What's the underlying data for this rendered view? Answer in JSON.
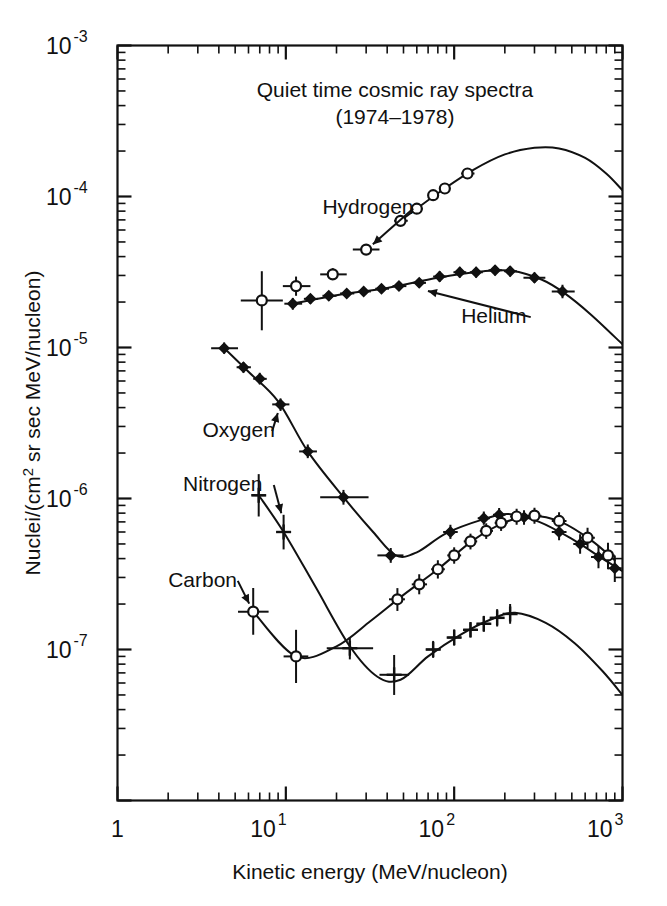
{
  "chart_data": {
    "type": "line",
    "title": "Quiet time cosmic ray spectra",
    "subtitle": "(1974–1978)",
    "xlabel": "Kinetic energy (MeV/nucleon)",
    "ylabel": "Nuclei/(cm² sr sec MeV/nucleon)",
    "xscale": "log",
    "yscale": "log",
    "xlim": [
      1,
      1000
    ],
    "ylim": [
      1e-08,
      0.001
    ],
    "grid": false,
    "legend_position": "inline-annotations",
    "xticklabels": [
      "1",
      "10",
      "10",
      "10"
    ],
    "xtick_exponents": [
      "",
      "1",
      "2",
      "3"
    ],
    "xticks": [
      1,
      10,
      100,
      1000
    ],
    "yticks": [
      0.001,
      0.0001,
      1e-05,
      1e-06,
      1e-07
    ],
    "yticklabels": [
      "10",
      "10",
      "10",
      "10",
      "10"
    ],
    "ytick_exponents": [
      "-3",
      "-4",
      "-5",
      "-6",
      "-7"
    ],
    "series": [
      {
        "name": "Hydrogen",
        "marker": "open-circle",
        "label_x": 16.5,
        "label_y": 7.6e-05,
        "arrow_to_x": 30,
        "arrow_to_y": 4.4e-05,
        "points": [
          {
            "x": 7.2,
            "y": 2.05e-05,
            "xerr_lo": 5.4,
            "xerr_hi": 9.6,
            "yerr_lo": 1.3e-05,
            "yerr_hi": 3.2e-05
          },
          {
            "x": 11.5,
            "y": 2.55e-05,
            "xerr_lo": 9.6,
            "xerr_hi": 14.0,
            "yerr_lo": 2.2e-05,
            "yerr_hi": 2.95e-05
          },
          {
            "x": 19.0,
            "y": 3.05e-05,
            "xerr_lo": 16.0,
            "xerr_hi": 23.0,
            "yerr_lo": 2.8e-05,
            "yerr_hi": 3.35e-05
          },
          {
            "x": 30.0,
            "y": 4.45e-05,
            "xerr_lo": 25.0,
            "xerr_hi": 36.0,
            "yerr_lo": 4.1e-05,
            "yerr_hi": 4.85e-05
          },
          {
            "x": 48.0,
            "y": 6.9e-05,
            "xerr_lo": 44.0,
            "xerr_hi": 53.0,
            "yerr_lo": 6.45e-05,
            "yerr_hi": 7.4e-05
          },
          {
            "x": 60.0,
            "y": 8.3e-05,
            "xerr_lo": 56.0,
            "xerr_hi": 65.0,
            "yerr_lo": 7.85e-05,
            "yerr_hi": 8.8e-05
          },
          {
            "x": 75.0,
            "y": 0.000102,
            "xerr_lo": 70.0,
            "xerr_hi": 81.0,
            "yerr_lo": 9.7e-05,
            "yerr_hi": 0.000108
          },
          {
            "x": 88.0,
            "y": 0.000113,
            "xerr_lo": 82.0,
            "xerr_hi": 95.0,
            "yerr_lo": 0.000107,
            "yerr_hi": 0.000119
          },
          {
            "x": 120.0,
            "y": 0.000142,
            "xerr_lo": 110.0,
            "xerr_hi": 132.0,
            "yerr_lo": 0.000135,
            "yerr_hi": 0.00015
          }
        ],
        "curve": [
          {
            "x": 48,
            "y": 6.9e-05
          },
          {
            "x": 80,
            "y": 0.000105
          },
          {
            "x": 130,
            "y": 0.00015
          },
          {
            "x": 200,
            "y": 0.00019
          },
          {
            "x": 300,
            "y": 0.00021
          },
          {
            "x": 420,
            "y": 0.000208
          },
          {
            "x": 600,
            "y": 0.00018
          },
          {
            "x": 800,
            "y": 0.000142
          },
          {
            "x": 1000,
            "y": 0.00011
          }
        ]
      },
      {
        "name": "Helium",
        "marker": "filled-diamond",
        "label_x": 110,
        "label_y": 1.45e-05,
        "arrow_to_x": 62,
        "arrow_to_y": 2.45e-05,
        "points": [
          {
            "x": 4.3,
            "y": 9.9e-06,
            "xerr_lo": 3.6,
            "xerr_hi": 5.2,
            "yerr_lo": 9.1e-06,
            "yerr_hi": 1.08e-05
          },
          {
            "x": 5.6,
            "y": 7.4e-06,
            "xerr_lo": 5.1,
            "xerr_hi": 6.2,
            "yerr_lo": 6.8e-06,
            "yerr_hi": 8e-06
          },
          {
            "x": 7.0,
            "y": 6.2e-06,
            "xerr_lo": 6.4,
            "xerr_hi": 7.7,
            "yerr_lo": 5.7e-06,
            "yerr_hi": 6.8e-06
          },
          {
            "x": 9.3,
            "y": 4.2e-06,
            "xerr_lo": 8.3,
            "xerr_hi": 10.5,
            "yerr_lo": 3.8e-06,
            "yerr_hi": 4.6e-06
          },
          {
            "x": 11.0,
            "y": 1.95e-05,
            "xerr_lo": 9.8,
            "xerr_hi": 12.5,
            "yerr_lo": 1.78e-05,
            "yerr_hi": 2.13e-05
          },
          {
            "x": 14.0,
            "y": 2.1e-05,
            "xerr_lo": 12.8,
            "xerr_hi": 15.5,
            "yerr_lo": 1.95e-05,
            "yerr_hi": 2.26e-05
          },
          {
            "x": 18.0,
            "y": 2.2e-05,
            "xerr_lo": 16.5,
            "xerr_hi": 20.0,
            "yerr_lo": 2.05e-05,
            "yerr_hi": 2.36e-05
          },
          {
            "x": 23.0,
            "y": 2.28e-05,
            "xerr_lo": 21.0,
            "xerr_hi": 25.5,
            "yerr_lo": 2.13e-05,
            "yerr_hi": 2.44e-05
          },
          {
            "x": 29.0,
            "y": 2.35e-05,
            "xerr_lo": 27.0,
            "xerr_hi": 32.0,
            "yerr_lo": 2.2e-05,
            "yerr_hi": 2.52e-05
          },
          {
            "x": 37.0,
            "y": 2.45e-05,
            "xerr_lo": 34.0,
            "xerr_hi": 41.0,
            "yerr_lo": 2.3e-05,
            "yerr_hi": 2.62e-05
          },
          {
            "x": 47.0,
            "y": 2.55e-05,
            "xerr_lo": 43.0,
            "xerr_hi": 52.0,
            "yerr_lo": 2.38e-05,
            "yerr_hi": 2.72e-05
          },
          {
            "x": 62.0,
            "y": 2.68e-05,
            "xerr_lo": 57.0,
            "xerr_hi": 68.0,
            "yerr_lo": 2.5e-05,
            "yerr_hi": 2.86e-05
          },
          {
            "x": 82.0,
            "y": 2.95e-05,
            "xerr_lo": 75.0,
            "xerr_hi": 90.0,
            "yerr_lo": 2.72e-05,
            "yerr_hi": 3.2e-05
          },
          {
            "x": 108.0,
            "y": 3.15e-05,
            "xerr_lo": 99.0,
            "xerr_hi": 118.0,
            "yerr_lo": 2.9e-05,
            "yerr_hi": 3.42e-05
          },
          {
            "x": 135.0,
            "y": 3.15e-05,
            "xerr_lo": 124.0,
            "xerr_hi": 148.0,
            "yerr_lo": 2.9e-05,
            "yerr_hi": 3.42e-05
          },
          {
            "x": 175.0,
            "y": 3.25e-05,
            "xerr_lo": 160.0,
            "xerr_hi": 192.0,
            "yerr_lo": 3e-05,
            "yerr_hi": 3.52e-05
          },
          {
            "x": 215.0,
            "y": 3.2e-05,
            "xerr_lo": 198.0,
            "xerr_hi": 236.0,
            "yerr_lo": 2.95e-05,
            "yerr_hi": 3.47e-05
          },
          {
            "x": 300.0,
            "y": 2.9e-05,
            "xerr_lo": 258.0,
            "xerr_hi": 348.0,
            "yerr_lo": 2.68e-05,
            "yerr_hi": 3.14e-05
          },
          {
            "x": 440.0,
            "y": 2.35e-05,
            "xerr_lo": 380.0,
            "xerr_hi": 520.0,
            "yerr_lo": 2.12e-05,
            "yerr_hi": 2.6e-05
          }
        ],
        "curve": [
          {
            "x": 11,
            "y": 1.95e-05
          },
          {
            "x": 20,
            "y": 2.22e-05
          },
          {
            "x": 40,
            "y": 2.48e-05
          },
          {
            "x": 80,
            "y": 2.9e-05
          },
          {
            "x": 150,
            "y": 3.2e-05
          },
          {
            "x": 220,
            "y": 3.22e-05
          },
          {
            "x": 330,
            "y": 2.82e-05
          },
          {
            "x": 450,
            "y": 2.3e-05
          },
          {
            "x": 650,
            "y": 1.65e-05
          },
          {
            "x": 1000,
            "y": 1.05e-05
          }
        ]
      },
      {
        "name": "Oxygen",
        "marker": "filled-diamond",
        "label_x": 3.2,
        "label_y": 2.55e-06,
        "arrow_to_x": 9.3,
        "arrow_to_y": 4.2e-06,
        "points": [
          {
            "x": 13.5,
            "y": 2.05e-06,
            "xerr_lo": 12.0,
            "xerr_hi": 15.3,
            "yerr_lo": 1.85e-06,
            "yerr_hi": 2.28e-06
          },
          {
            "x": 22.0,
            "y": 1.02e-06,
            "xerr_lo": 16.0,
            "xerr_hi": 31.0,
            "yerr_lo": 9.1e-07,
            "yerr_hi": 1.14e-06
          },
          {
            "x": 42.0,
            "y": 4.2e-07,
            "xerr_lo": 35.0,
            "xerr_hi": 50.0,
            "yerr_lo": 3.75e-07,
            "yerr_hi": 4.7e-07
          },
          {
            "x": 95.0,
            "y": 6e-07,
            "xerr_lo": 86.0,
            "xerr_hi": 105.0,
            "yerr_lo": 5.4e-07,
            "yerr_hi": 6.7e-07
          },
          {
            "x": 150.0,
            "y": 7.4e-07,
            "xerr_lo": 138.0,
            "xerr_hi": 163.0,
            "yerr_lo": 6.7e-07,
            "yerr_hi": 8.2e-07
          },
          {
            "x": 185.0,
            "y": 7.8e-07,
            "xerr_lo": 170.0,
            "xerr_hi": 202.0,
            "yerr_lo": 7e-07,
            "yerr_hi": 8.65e-07
          },
          {
            "x": 260.0,
            "y": 7.5e-07,
            "xerr_lo": 236.0,
            "xerr_hi": 288.0,
            "yerr_lo": 6.7e-07,
            "yerr_hi": 8.35e-07
          },
          {
            "x": 420.0,
            "y": 6e-07,
            "xerr_lo": 380.0,
            "xerr_hi": 465.0,
            "yerr_lo": 5.3e-07,
            "yerr_hi": 6.8e-07
          },
          {
            "x": 560.0,
            "y": 5e-07,
            "xerr_lo": 510.0,
            "xerr_hi": 620.0,
            "yerr_lo": 4.3e-07,
            "yerr_hi": 5.8e-07
          },
          {
            "x": 720.0,
            "y": 4.1e-07,
            "xerr_lo": 650.0,
            "xerr_hi": 800.0,
            "yerr_lo": 3.45e-07,
            "yerr_hi": 4.85e-07
          },
          {
            "x": 900.0,
            "y": 3.45e-07,
            "xerr_lo": 820.0,
            "xerr_hi": 990.0,
            "yerr_lo": 2.8e-07,
            "yerr_hi": 4.2e-07
          }
        ],
        "curve": [
          {
            "x": 4.3,
            "y": 9.9e-06
          },
          {
            "x": 6,
            "y": 6.9e-06
          },
          {
            "x": 9,
            "y": 4.4e-06
          },
          {
            "x": 13.5,
            "y": 2.05e-06
          },
          {
            "x": 22,
            "y": 1.02e-06
          },
          {
            "x": 33,
            "y": 6e-07
          },
          {
            "x": 45,
            "y": 4.2e-07
          },
          {
            "x": 60,
            "y": 4.4e-07
          },
          {
            "x": 90,
            "y": 5.9e-07
          },
          {
            "x": 150,
            "y": 7.3e-07
          },
          {
            "x": 210,
            "y": 7.9e-07
          },
          {
            "x": 320,
            "y": 7e-07
          },
          {
            "x": 500,
            "y": 5.4e-07
          },
          {
            "x": 760,
            "y": 4e-07
          },
          {
            "x": 1000,
            "y": 3.3e-07
          }
        ]
      },
      {
        "name": "Nitrogen",
        "marker": "plus",
        "label_x": 2.45,
        "label_y": 1.12e-06,
        "arrow_to_x": 9.7,
        "arrow_to_y": 7e-07,
        "points": [
          {
            "x": 6.9,
            "y": 1.05e-06,
            "xerr_lo": 6.3,
            "xerr_hi": 7.6,
            "yerr_lo": 7.6e-07,
            "yerr_hi": 1.45e-06
          },
          {
            "x": 9.7,
            "y": 6e-07,
            "xerr_lo": 8.8,
            "xerr_hi": 10.7,
            "yerr_lo": 4.6e-07,
            "yerr_hi": 7.8e-07
          },
          {
            "x": 24.0,
            "y": 1.02e-07,
            "xerr_lo": 17.5,
            "xerr_hi": 33.0,
            "yerr_lo": 8.6e-08,
            "yerr_hi": 1.21e-07
          },
          {
            "x": 44.0,
            "y": 6.8e-08,
            "xerr_lo": 36.0,
            "xerr_hi": 54.0,
            "yerr_lo": 5e-08,
            "yerr_hi": 9.2e-08
          },
          {
            "x": 75.0,
            "y": 1e-07,
            "xerr_lo": 68.0,
            "xerr_hi": 83.0,
            "yerr_lo": 8.8e-08,
            "yerr_hi": 1.14e-07
          },
          {
            "x": 100.0,
            "y": 1.2e-07,
            "xerr_lo": 91.0,
            "xerr_hi": 110.0,
            "yerr_lo": 1.06e-07,
            "yerr_hi": 1.36e-07
          },
          {
            "x": 125.0,
            "y": 1.35e-07,
            "xerr_lo": 114.0,
            "xerr_hi": 137.0,
            "yerr_lo": 1.2e-07,
            "yerr_hi": 1.52e-07
          },
          {
            "x": 150.0,
            "y": 1.48e-07,
            "xerr_lo": 137.0,
            "xerr_hi": 164.0,
            "yerr_lo": 1.31e-07,
            "yerr_hi": 1.67e-07
          },
          {
            "x": 180.0,
            "y": 1.62e-07,
            "xerr_lo": 164.0,
            "xerr_hi": 197.0,
            "yerr_lo": 1.42e-07,
            "yerr_hi": 1.85e-07
          },
          {
            "x": 215.0,
            "y": 1.72e-07,
            "xerr_lo": 196.0,
            "xerr_hi": 236.0,
            "yerr_lo": 1.48e-07,
            "yerr_hi": 2e-07
          }
        ],
        "curve": [
          {
            "x": 6.9,
            "y": 1.05e-06
          },
          {
            "x": 9.7,
            "y": 6e-07
          },
          {
            "x": 15,
            "y": 2.6e-07
          },
          {
            "x": 24,
            "y": 1.05e-07
          },
          {
            "x": 35,
            "y": 6.6e-08
          },
          {
            "x": 48,
            "y": 6.3e-08
          },
          {
            "x": 70,
            "y": 9e-08
          },
          {
            "x": 110,
            "y": 1.26e-07
          },
          {
            "x": 165,
            "y": 1.58e-07
          },
          {
            "x": 230,
            "y": 1.75e-07
          },
          {
            "x": 350,
            "y": 1.5e-07
          },
          {
            "x": 520,
            "y": 1.1e-07
          },
          {
            "x": 760,
            "y": 7.2e-08
          },
          {
            "x": 1000,
            "y": 5e-08
          }
        ]
      },
      {
        "name": "Carbon",
        "marker": "open-circle",
        "label_x": 2.0,
        "label_y": 2.6e-07,
        "arrow_to_x": 6.4,
        "arrow_to_y": 1.78e-07,
        "points": [
          {
            "x": 6.4,
            "y": 1.78e-07,
            "xerr_lo": 5.2,
            "xerr_hi": 7.9,
            "yerr_lo": 1.25e-07,
            "yerr_hi": 2.55e-07
          },
          {
            "x": 11.5,
            "y": 9e-08,
            "xerr_lo": 9.7,
            "xerr_hi": 13.6,
            "yerr_lo": 6e-08,
            "yerr_hi": 1.35e-07
          },
          {
            "x": 46.0,
            "y": 2.15e-07,
            "xerr_lo": 41.0,
            "xerr_hi": 51.0,
            "yerr_lo": 1.8e-07,
            "yerr_hi": 2.55e-07
          },
          {
            "x": 62.0,
            "y": 2.7e-07,
            "xerr_lo": 56.0,
            "xerr_hi": 69.0,
            "yerr_lo": 2.32e-07,
            "yerr_hi": 3.15e-07
          },
          {
            "x": 80.0,
            "y": 3.4e-07,
            "xerr_lo": 73.0,
            "xerr_hi": 88.0,
            "yerr_lo": 2.95e-07,
            "yerr_hi": 3.9e-07
          },
          {
            "x": 100.0,
            "y": 4.2e-07,
            "xerr_lo": 91.0,
            "xerr_hi": 110.0,
            "yerr_lo": 3.7e-07,
            "yerr_hi": 4.75e-07
          },
          {
            "x": 125.0,
            "y": 5.2e-07,
            "xerr_lo": 114.0,
            "xerr_hi": 137.0,
            "yerr_lo": 4.6e-07,
            "yerr_hi": 5.85e-07
          },
          {
            "x": 155.0,
            "y": 6.1e-07,
            "xerr_lo": 142.0,
            "xerr_hi": 170.0,
            "yerr_lo": 5.4e-07,
            "yerr_hi": 6.85e-07
          },
          {
            "x": 190.0,
            "y": 6.9e-07,
            "xerr_lo": 174.0,
            "xerr_hi": 208.0,
            "yerr_lo": 6.1e-07,
            "yerr_hi": 7.75e-07
          },
          {
            "x": 235.0,
            "y": 7.6e-07,
            "xerr_lo": 215.0,
            "xerr_hi": 258.0,
            "yerr_lo": 6.7e-07,
            "yerr_hi": 8.55e-07
          },
          {
            "x": 300.0,
            "y": 7.7e-07,
            "xerr_lo": 272.0,
            "xerr_hi": 330.0,
            "yerr_lo": 6.8e-07,
            "yerr_hi": 8.7e-07
          },
          {
            "x": 420.0,
            "y": 7.1e-07,
            "xerr_lo": 380.0,
            "xerr_hi": 465.0,
            "yerr_lo": 6.2e-07,
            "yerr_hi": 8.1e-07
          },
          {
            "x": 620.0,
            "y": 5.5e-07,
            "xerr_lo": 560.0,
            "xerr_hi": 685.0,
            "yerr_lo": 4.7e-07,
            "yerr_hi": 6.4e-07
          },
          {
            "x": 820.0,
            "y": 4.2e-07,
            "xerr_lo": 745.0,
            "xerr_hi": 900.0,
            "yerr_lo": 3.4e-07,
            "yerr_hi": 5.1e-07
          }
        ],
        "curve": [
          {
            "x": 6.4,
            "y": 1.78e-07
          },
          {
            "x": 11.5,
            "y": 9e-08
          },
          {
            "x": 20,
            "y": 1.05e-07
          },
          {
            "x": 32,
            "y": 1.55e-07
          },
          {
            "x": 50,
            "y": 2.3e-07
          },
          {
            "x": 80,
            "y": 3.4e-07
          },
          {
            "x": 130,
            "y": 5.3e-07
          },
          {
            "x": 200,
            "y": 6.95e-07
          },
          {
            "x": 290,
            "y": 7.7e-07
          },
          {
            "x": 430,
            "y": 7e-07
          },
          {
            "x": 650,
            "y": 5.3e-07
          },
          {
            "x": 900,
            "y": 3.9e-07
          }
        ]
      }
    ]
  }
}
